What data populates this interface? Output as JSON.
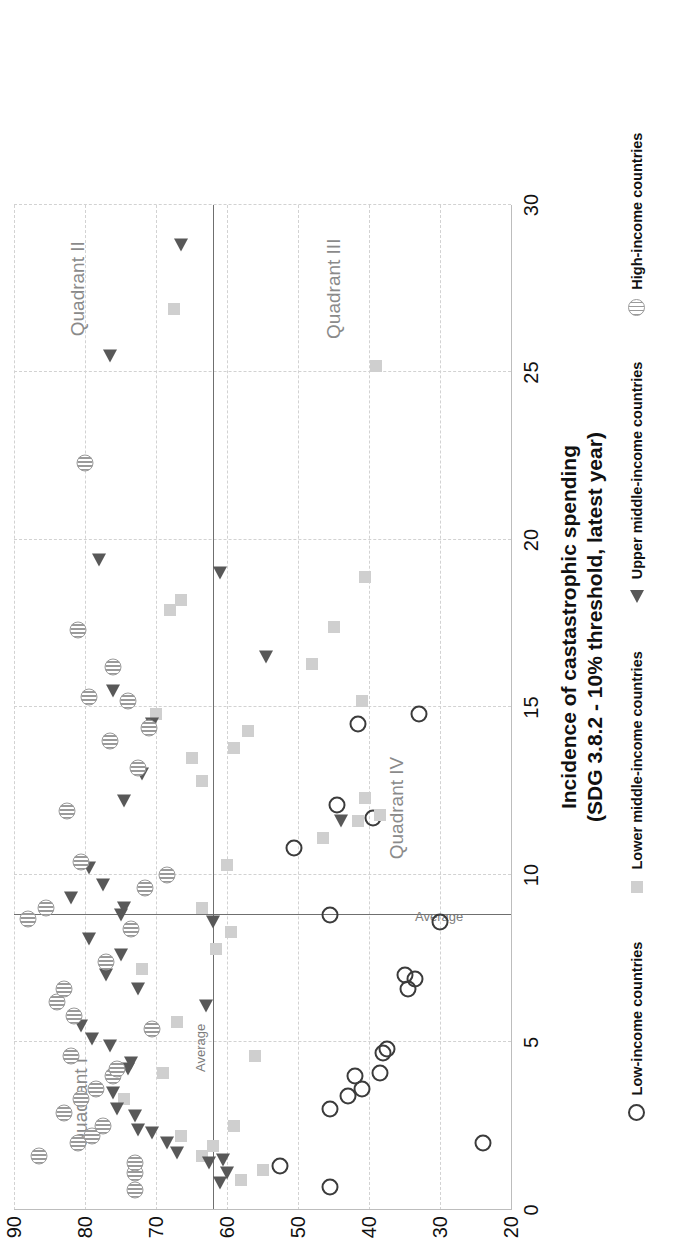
{
  "chart_data": {
    "type": "scatter",
    "title": "Incidence of castastrophic spending",
    "subtitle": "(SDG 3.8.2 - 10% threshold, latest year)",
    "xlabel": "Incidence of castastrophic spending (SDG 3.8.2 - 10% threshold, latest year)",
    "ylabel": "",
    "xlim": [
      0,
      30
    ],
    "ylim": [
      20,
      90
    ],
    "xticks": [
      0,
      5,
      10,
      15,
      20,
      25,
      30
    ],
    "yticks": [
      20,
      30,
      40,
      50,
      60,
      70,
      80,
      90
    ],
    "grid": true,
    "legend_position": "bottom",
    "reference_lines": [
      {
        "axis": "x",
        "value": 8.8,
        "label": "Average"
      },
      {
        "axis": "y",
        "value": 62.0,
        "label": "Average"
      }
    ],
    "quadrants": [
      {
        "label": "Quadrant I",
        "x": 3.2,
        "y": 80.5
      },
      {
        "label": "Quadrant II",
        "x": 27.5,
        "y": 81.0
      },
      {
        "label": "Quadrant III",
        "x": 27.5,
        "y": 45.0
      },
      {
        "label": "Quadrant IV",
        "x": 12.0,
        "y": 36.0
      }
    ],
    "series": [
      {
        "name": "Low-income countries",
        "marker": "open-circle",
        "color": "#3b3b3b",
        "points": [
          [
            0.7,
            45.5
          ],
          [
            1.3,
            52.5
          ],
          [
            2.0,
            24.0
          ],
          [
            3.0,
            45.5
          ],
          [
            3.4,
            43.0
          ],
          [
            3.6,
            41.0
          ],
          [
            4.0,
            42.0
          ],
          [
            4.1,
            38.5
          ],
          [
            4.7,
            38.0
          ],
          [
            4.8,
            37.5
          ],
          [
            6.6,
            34.5
          ],
          [
            6.9,
            33.5
          ],
          [
            7.0,
            35.0
          ],
          [
            8.8,
            45.5
          ],
          [
            10.8,
            50.5
          ],
          [
            11.7,
            39.5
          ],
          [
            12.1,
            44.5
          ],
          [
            14.5,
            41.5
          ],
          [
            14.8,
            33.0
          ],
          [
            8.6,
            30.0
          ]
        ]
      },
      {
        "name": "Lower middle-income countries",
        "marker": "filled-square",
        "color": "#cfcfcf",
        "points": [
          [
            0.9,
            58.0
          ],
          [
            1.2,
            55.0
          ],
          [
            1.6,
            63.5
          ],
          [
            1.9,
            62.0
          ],
          [
            2.2,
            66.5
          ],
          [
            2.5,
            59.0
          ],
          [
            3.3,
            74.5
          ],
          [
            4.1,
            69.0
          ],
          [
            4.6,
            56.0
          ],
          [
            5.6,
            67.0
          ],
          [
            7.2,
            72.0
          ],
          [
            7.8,
            61.5
          ],
          [
            8.3,
            59.5
          ],
          [
            9.0,
            63.5
          ],
          [
            9.6,
            71.5
          ],
          [
            10.3,
            60.0
          ],
          [
            11.1,
            46.5
          ],
          [
            11.6,
            41.5
          ],
          [
            11.8,
            38.5
          ],
          [
            12.3,
            40.5
          ],
          [
            12.8,
            63.5
          ],
          [
            13.5,
            65.0
          ],
          [
            13.8,
            59.0
          ],
          [
            14.3,
            57.0
          ],
          [
            14.8,
            70.0
          ],
          [
            15.2,
            41.0
          ],
          [
            16.3,
            48.0
          ],
          [
            17.4,
            45.0
          ],
          [
            17.9,
            68.0
          ],
          [
            18.2,
            66.5
          ],
          [
            18.9,
            40.5
          ],
          [
            25.2,
            39.0
          ],
          [
            26.9,
            67.5
          ]
        ]
      },
      {
        "name": "Upper middle-income countries",
        "marker": "triangle",
        "color": "#585858",
        "points": [
          [
            0.8,
            61.0
          ],
          [
            1.1,
            60.0
          ],
          [
            1.4,
            62.5
          ],
          [
            1.5,
            60.5
          ],
          [
            1.7,
            67.0
          ],
          [
            2.0,
            68.5
          ],
          [
            2.3,
            70.5
          ],
          [
            2.4,
            72.5
          ],
          [
            2.8,
            73.0
          ],
          [
            3.0,
            75.5
          ],
          [
            3.5,
            76.0
          ],
          [
            4.2,
            74.0
          ],
          [
            4.4,
            73.5
          ],
          [
            4.9,
            76.5
          ],
          [
            5.1,
            79.0
          ],
          [
            5.5,
            80.5
          ],
          [
            6.1,
            63.0
          ],
          [
            6.6,
            72.5
          ],
          [
            7.0,
            77.0
          ],
          [
            7.6,
            75.0
          ],
          [
            8.1,
            79.5
          ],
          [
            8.6,
            62.0
          ],
          [
            8.8,
            75.0
          ],
          [
            9.0,
            74.5
          ],
          [
            9.3,
            82.0
          ],
          [
            9.7,
            77.5
          ],
          [
            10.2,
            79.5
          ],
          [
            11.6,
            44.0
          ],
          [
            12.2,
            74.5
          ],
          [
            13.0,
            72.0
          ],
          [
            14.5,
            70.5
          ],
          [
            15.5,
            76.0
          ],
          [
            16.5,
            54.5
          ],
          [
            19.0,
            61.0
          ],
          [
            19.4,
            78.0
          ],
          [
            25.5,
            76.5
          ],
          [
            28.8,
            66.5
          ]
        ]
      },
      {
        "name": "High-income countries",
        "marker": "hatched-circle",
        "color": "#9a9a9a",
        "points": [
          [
            0.6,
            73.0
          ],
          [
            1.1,
            73.0
          ],
          [
            1.4,
            73.0
          ],
          [
            1.6,
            86.5
          ],
          [
            2.0,
            81.0
          ],
          [
            2.2,
            79.0
          ],
          [
            2.5,
            77.5
          ],
          [
            2.9,
            83.0
          ],
          [
            3.3,
            80.5
          ],
          [
            3.6,
            78.5
          ],
          [
            4.0,
            76.0
          ],
          [
            4.2,
            75.5
          ],
          [
            4.6,
            82.0
          ],
          [
            5.4,
            70.5
          ],
          [
            5.8,
            81.5
          ],
          [
            6.2,
            84.0
          ],
          [
            6.6,
            83.0
          ],
          [
            7.4,
            77.0
          ],
          [
            8.4,
            73.5
          ],
          [
            8.7,
            88.0
          ],
          [
            9.0,
            85.5
          ],
          [
            9.6,
            71.5
          ],
          [
            10.0,
            68.5
          ],
          [
            10.4,
            80.5
          ],
          [
            11.9,
            82.5
          ],
          [
            13.2,
            72.5
          ],
          [
            14.0,
            76.5
          ],
          [
            14.4,
            71.0
          ],
          [
            15.2,
            74.0
          ],
          [
            15.3,
            79.5
          ],
          [
            16.2,
            76.0
          ],
          [
            17.3,
            81.0
          ],
          [
            22.3,
            80.0
          ]
        ]
      }
    ]
  },
  "legend": {
    "items": [
      {
        "label": "Low-income countries",
        "marker": "open-circle-icon"
      },
      {
        "label": "Lower middle-income countries",
        "marker": "filled-square-icon"
      },
      {
        "label": "Upper middle-income countries",
        "marker": "triangle-icon"
      },
      {
        "label": "High-income countries",
        "marker": "hatched-circle-icon"
      }
    ]
  }
}
